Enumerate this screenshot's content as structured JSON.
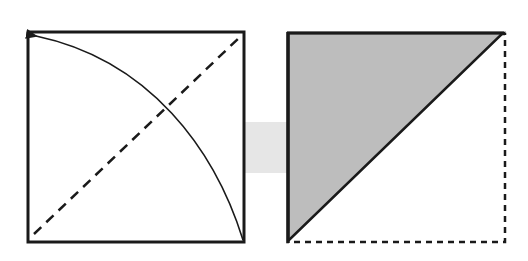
{
  "diagram": {
    "title": "",
    "colors": {
      "background": "#ffffff",
      "stroke": "#1a1a1a",
      "fill_shaded": "#bdbdbd",
      "connector": "#e6e6e6"
    },
    "steps": [
      {
        "id": "before",
        "shape": "square",
        "crease": "diagonal dashed valley fold from bottom-left to top-right",
        "arrow": "curved arrow from bottom-right corner to top-left corner"
      },
      {
        "id": "after",
        "shape": "triangle (folded)",
        "hidden_edges": "dashed outline of original bottom and right edges",
        "fill": "shaded triangle upper-left"
      }
    ]
  }
}
